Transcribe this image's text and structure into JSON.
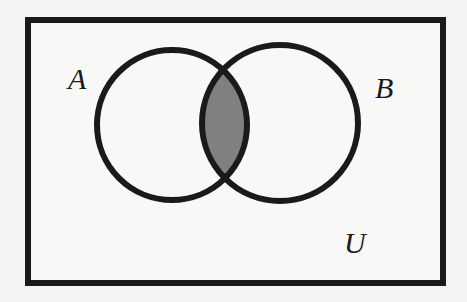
{
  "diagram": {
    "type": "venn",
    "universe_label": "U",
    "sets": [
      {
        "id": "A",
        "label": "A"
      },
      {
        "id": "B",
        "label": "B"
      }
    ],
    "shaded_region": "A ∩ B",
    "colors": {
      "background": "#f4f4f2",
      "outline": "#1a1a1a",
      "shade": "#808080"
    }
  }
}
